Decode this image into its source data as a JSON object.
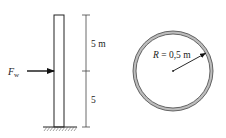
{
  "column": {
    "force_label": "F",
    "force_subscript": "w",
    "upper_dimension": "5 m",
    "lower_dimension": "5"
  },
  "cross_section": {
    "radius_var": "R",
    "radius_value": " = 0,5 m"
  },
  "colors": {
    "line": "#222222",
    "ring_fill": "#bdbdbd"
  }
}
